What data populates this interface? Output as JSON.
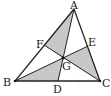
{
  "diagram": {
    "points": {
      "A": {
        "label": "A",
        "x": 74,
        "y": 9
      },
      "B": {
        "label": "B",
        "x": 15,
        "y": 81
      },
      "C": {
        "label": "C",
        "x": 100,
        "y": 81
      },
      "D": {
        "label": "D",
        "x": 58,
        "y": 81
      },
      "E": {
        "label": "E",
        "x": 88,
        "y": 46
      },
      "F": {
        "label": "F",
        "x": 44,
        "y": 45
      },
      "G": {
        "label": "G",
        "x": 63,
        "y": 58
      }
    },
    "shaded_regions": [
      "AFG",
      "BDG",
      "GEC"
    ],
    "shade_color": "#c8c8c8",
    "line_color": "#222222",
    "midpoint_ticks_on": "BC"
  }
}
